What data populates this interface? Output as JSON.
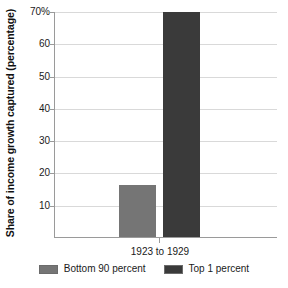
{
  "chart_data": {
    "type": "bar",
    "title": "",
    "xlabel": "",
    "ylabel": "Share of income growth captured (percentage)",
    "categories": [
      "1923 to 1929"
    ],
    "series": [
      {
        "name": "Bottom 90 percent",
        "values": [
          16
        ],
        "color": "#757575"
      },
      {
        "name": "Top 1 percent",
        "values": [
          70
        ],
        "color": "#3a3a3a"
      }
    ],
    "ylim": [
      0,
      70
    ],
    "yticks": [
      10,
      20,
      30,
      40,
      50,
      60,
      70
    ],
    "ytick_labels": [
      "10",
      "20",
      "30",
      "40",
      "50",
      "60",
      "70%"
    ],
    "grid": true,
    "legend_position": "bottom"
  },
  "axes": {
    "y_title": "Share of income growth captured (percentage)",
    "y_ticks": [
      {
        "value": 70,
        "label": "70%"
      },
      {
        "value": 60,
        "label": "60"
      },
      {
        "value": 50,
        "label": "50"
      },
      {
        "value": 40,
        "label": "40"
      },
      {
        "value": 30,
        "label": "30"
      },
      {
        "value": 20,
        "label": "20"
      },
      {
        "value": 10,
        "label": "10"
      }
    ],
    "x_ticks": [
      {
        "label": "1923 to 1929"
      }
    ]
  },
  "bars": [
    {
      "name": "bottom-90-percent",
      "value": 16,
      "color": "#757575"
    },
    {
      "name": "top-1-percent",
      "value": 70,
      "color": "#3a3a3a"
    }
  ],
  "legend": {
    "items": [
      {
        "label": "Bottom 90 percent",
        "color": "#757575"
      },
      {
        "label": "Top 1 percent",
        "color": "#3a3a3a"
      }
    ]
  },
  "colors": {
    "background": "#ffffff",
    "axis": "#9a9a9a",
    "grid": "#d9d9d9",
    "text": "#1a1a1a"
  }
}
